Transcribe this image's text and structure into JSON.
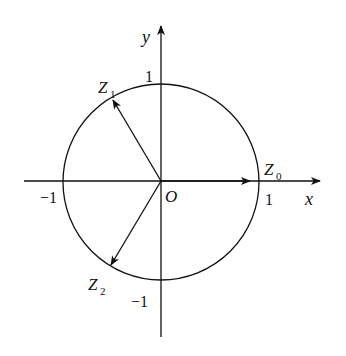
{
  "diagram": {
    "type": "complex-plane-unit-circle",
    "axes": {
      "x_label": "x",
      "y_label": "y",
      "origin_label": "O"
    },
    "ticks": {
      "x_pos": "1",
      "x_neg": "−1",
      "y_pos": "1",
      "y_neg": "−1"
    },
    "points": [
      {
        "name": "Z",
        "sub": "0",
        "angle_deg": 0
      },
      {
        "name": "Z",
        "sub": "1",
        "angle_deg": 120
      },
      {
        "name": "Z",
        "sub": "2",
        "angle_deg": 240
      }
    ],
    "colors": {
      "stroke": "#111111",
      "background": "#ffffff"
    }
  }
}
